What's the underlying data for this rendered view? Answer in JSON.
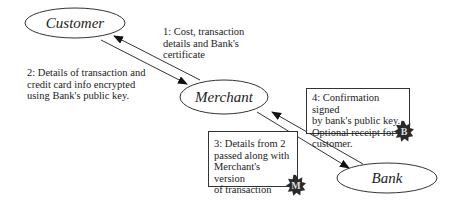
{
  "diagram": {
    "nodes": [
      {
        "id": "customer",
        "label": "Customer",
        "cx": 75,
        "cy": 23,
        "rx": 50,
        "ry": 15
      },
      {
        "id": "merchant",
        "label": "Merchant",
        "cx": 224,
        "cy": 97,
        "rx": 44,
        "ry": 17
      },
      {
        "id": "bank",
        "label": "Bank",
        "cx": 387,
        "cy": 178,
        "rx": 50,
        "ry": 15
      }
    ],
    "edges": [
      {
        "id": "e1",
        "from": "merchant",
        "to": "customer",
        "label_ref": "step1"
      },
      {
        "id": "e2",
        "from": "customer",
        "to": "merchant",
        "label_ref": "step2"
      },
      {
        "id": "e3",
        "from": "merchant",
        "to": "bank",
        "label_ref": "step3"
      },
      {
        "id": "e4",
        "from": "bank",
        "to": "merchant",
        "label_ref": "step4"
      }
    ],
    "steps": {
      "step1": {
        "lines": [
          "1: Cost, transaction",
          "details and Bank's",
          "certificate"
        ]
      },
      "step2": {
        "lines": [
          "2: Details of transaction and",
          "credit card info encrypted",
          "using Bank's public key."
        ]
      },
      "step3": {
        "lines": [
          "3: Details from 2",
          "passed along with",
          "Merchant's version",
          "of transaction"
        ],
        "badge": "M"
      },
      "step4": {
        "lines": [
          "4: Confirmation signed",
          "by bank's public key.",
          "Optional receipt for",
          "customer."
        ],
        "badge": "B"
      }
    },
    "colors": {
      "line": "#333333",
      "badge": "#2a2a2a",
      "text": "#222222"
    }
  }
}
